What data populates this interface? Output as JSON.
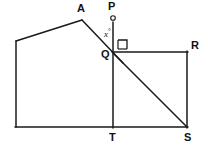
{
  "figure": {
    "type": "geometry-diagram",
    "stroke_color": "#1a1a1a",
    "background_color": "#ffffff",
    "stroke_width": 1.4,
    "points": [
      {
        "name": "A",
        "label": "A",
        "x": 82,
        "y": 20,
        "label_x": 78,
        "label_y": 3
      },
      {
        "name": "P",
        "label": "P",
        "x": 113,
        "y": 18,
        "label_x": 109,
        "label_y": 1
      },
      {
        "name": "Q",
        "label": "Q",
        "x": 113,
        "y": 53,
        "label_x": 102,
        "label_y": 50
      },
      {
        "name": "R",
        "label": "R",
        "x": 187,
        "y": 52,
        "label_x": 192,
        "label_y": 41
      },
      {
        "name": "S",
        "label": "S",
        "x": 187,
        "y": 127,
        "label_x": 185,
        "label_y": 133
      },
      {
        "name": "T",
        "label": "T",
        "x": 113,
        "y": 127,
        "label_x": 110,
        "label_y": 133
      },
      {
        "name": "L",
        "label": "",
        "x": 16,
        "y": 41,
        "label_x": 0,
        "label_y": 0
      },
      {
        "name": "B",
        "label": "",
        "x": 16,
        "y": 127,
        "label_x": 0,
        "label_y": 0
      }
    ],
    "segments": [
      {
        "name": "left-upper-edge",
        "from": "L",
        "to": "A",
        "x1": 16,
        "y1": 41,
        "x2": 82,
        "y2": 20
      },
      {
        "name": "left-side-edge",
        "from": "L",
        "to": "B",
        "x1": 16,
        "y1": 41,
        "x2": 16,
        "y2": 127
      },
      {
        "name": "base-edge",
        "from": "B",
        "to": "S",
        "x1": 16,
        "y1": 127,
        "x2": 187,
        "y2": 127
      },
      {
        "name": "ray-A-to-P",
        "from": "A",
        "to": "P",
        "x1": 82,
        "y1": 20,
        "x2": 113,
        "y2": 14
      },
      {
        "name": "segment-A-to-Q",
        "from": "A",
        "to": "Q",
        "x1": 82,
        "y1": 20,
        "x2": 120,
        "y2": 60
      },
      {
        "name": "segment-Q-to-R",
        "from": "Q",
        "to": "R",
        "x1": 113,
        "y1": 52,
        "x2": 187,
        "y2": 52
      },
      {
        "name": "segment-R-to-S",
        "from": "R",
        "to": "S",
        "x1": 187,
        "y1": 52,
        "x2": 187,
        "y2": 127
      },
      {
        "name": "diagonal-Q-to-S",
        "from": "Q",
        "to": "S",
        "x1": 113,
        "y1": 53,
        "x2": 187,
        "y2": 127
      },
      {
        "name": "segment-P-to-T",
        "from": "P",
        "to": "T",
        "x1": 113,
        "y1": 22,
        "x2": 113,
        "y2": 127
      }
    ],
    "markers": {
      "point_P_dot": {
        "name": "point-marker-P",
        "cx": 113,
        "cy": 18,
        "r": 2.2,
        "filled": false
      },
      "right_angle": {
        "name": "right-angle-marker",
        "at_vertex": "Q",
        "x": 118,
        "y": 40,
        "size": 9,
        "value": "90"
      }
    },
    "angle_labels": [
      {
        "name": "angle-x",
        "text": "x",
        "unit": "°",
        "x": 105,
        "y": 27,
        "at_vertex": "Q",
        "between": "QA and QP"
      }
    ]
  }
}
